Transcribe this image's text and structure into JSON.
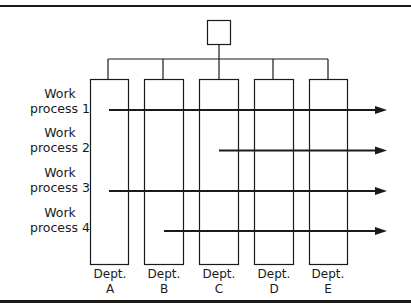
{
  "diagram": {
    "type": "matrix-organization",
    "top_box": {
      "label": ""
    },
    "departments": [
      {
        "name": "Dept.",
        "letter": "A"
      },
      {
        "name": "Dept.",
        "letter": "B"
      },
      {
        "name": "Dept.",
        "letter": "C"
      },
      {
        "name": "Dept.",
        "letter": "D"
      },
      {
        "name": "Dept.",
        "letter": "E"
      }
    ],
    "processes": [
      {
        "line1": "Work",
        "line2": "process 1",
        "starts_at_dept": "A"
      },
      {
        "line1": "Work",
        "line2": "process 2",
        "starts_at_dept": "C"
      },
      {
        "line1": "Work",
        "line2": "process 3",
        "starts_at_dept": "A"
      },
      {
        "line1": "Work",
        "line2": "process 4",
        "starts_at_dept": "B"
      }
    ],
    "colors": {
      "line": "#1a1a1a",
      "background": "#ffffff"
    }
  }
}
